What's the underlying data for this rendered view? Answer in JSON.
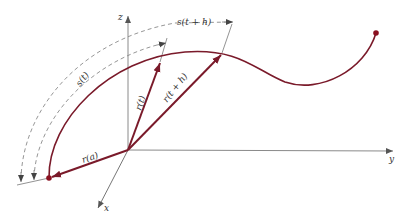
{
  "figure": {
    "colors": {
      "curve": "#7a1a2a",
      "vector": "#7a1a2a",
      "axis": "#8a8a8a",
      "dashed": "#8a8a8a",
      "text": "#333333",
      "background": "#ffffff"
    },
    "axes": {
      "x_label": "x",
      "y_label": "y",
      "z_label": "z"
    },
    "labels": {
      "s_t": "s(t)",
      "s_t_plus_h": "s(t + h)",
      "r_t": "r(t)",
      "r_t_plus_h": "r(t + h)",
      "r_a": "r(a)"
    },
    "points": {
      "origin": [
        128,
        150
      ],
      "start_point": [
        49,
        178
      ],
      "end_point": [
        376,
        33
      ],
      "r_t_tip": [
        160,
        62
      ],
      "r_t_plus_h_tip": [
        222,
        53
      ]
    }
  }
}
